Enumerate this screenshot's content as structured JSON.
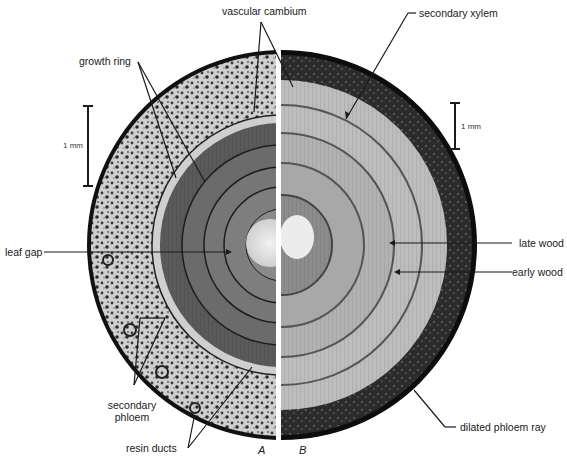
{
  "figure": {
    "panels": [
      {
        "id": "A",
        "label": "A"
      },
      {
        "id": "B",
        "label": "B"
      }
    ],
    "scale_bars": [
      {
        "panel": "A",
        "label": "1 mm"
      },
      {
        "panel": "B",
        "label": "1 mm"
      }
    ],
    "labels": {
      "vascular_cambium": "vascular cambium",
      "secondary_xylem": "secondary xylem",
      "growth_ring": "growth ring",
      "leaf_gap": "leaf gap",
      "late_wood": "late wood",
      "early_wood": "early wood",
      "secondary_phloem_line1": "secondary",
      "secondary_phloem_line2": "phloem",
      "resin_ducts": "resin ducts",
      "dilated_phloem_ray": "dilated phloem ray"
    },
    "colors": {
      "background": "#ffffff",
      "ink": "#1a1a1a",
      "bark_dark": "#2b2b2b",
      "phloem_light": "#d9d9d9",
      "xylem_mid": "#7a7a7a",
      "xylem_light": "#bdbdbd",
      "pith": "#e8e8e8"
    }
  }
}
